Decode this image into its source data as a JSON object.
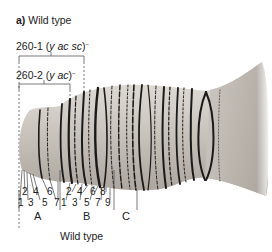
{
  "figure": {
    "panel_letter": "a)",
    "panel_title": "Wild type",
    "caption": "Wild type",
    "deficiencies": [
      {
        "name": "260-1",
        "genes": "y ac sc",
        "superscript": "−"
      },
      {
        "name": "260-2",
        "genes": "y ac",
        "superscript": "−"
      }
    ],
    "band_numbers_top_A": [
      "2",
      "4",
      "6"
    ],
    "band_numbers_bottom_A": [
      "1",
      "3",
      "5",
      "7"
    ],
    "band_numbers_top_B": [
      "2",
      "4",
      "6",
      "8"
    ],
    "band_numbers_bottom_B": [
      "1",
      "3",
      "5",
      "7",
      "9"
    ],
    "regions": [
      "A",
      "B",
      "C"
    ],
    "colors": {
      "chromosome_fill": "#c9c4bd",
      "band": "#1a1a1a",
      "lines": "#444444"
    }
  }
}
